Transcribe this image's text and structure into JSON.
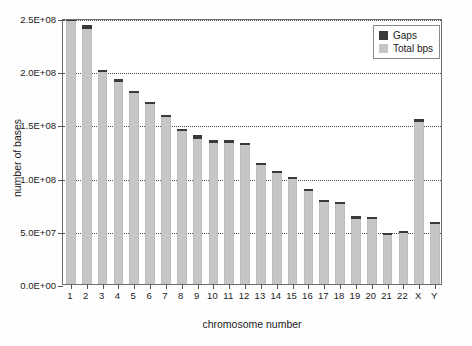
{
  "chart_data": {
    "type": "bar",
    "title": "",
    "xlabel": "chromosome number",
    "ylabel": "number of bases",
    "categories": [
      "1",
      "2",
      "3",
      "4",
      "5",
      "6",
      "7",
      "8",
      "9",
      "10",
      "11",
      "12",
      "13",
      "14",
      "15",
      "16",
      "17",
      "18",
      "19",
      "20",
      "21",
      "22",
      "X",
      "Y"
    ],
    "ylim": [
      0,
      250000000
    ],
    "ytick_values": [
      0,
      50000000,
      100000000,
      150000000,
      200000000,
      250000000
    ],
    "ytick_labels": [
      "0.0E+00",
      "5.0E+07",
      "1.0E+08",
      "1.5E+08",
      "2.0E+08",
      "2.5E+08"
    ],
    "grid": true,
    "grid_axis": "y",
    "legend_position": "top-right",
    "stacked": true,
    "series": [
      {
        "name": "Total bps",
        "color": "#c6c6c6",
        "values": [
          247000000,
          240000000,
          199500000,
          190000000,
          179500000,
          169000000,
          156500000,
          144000000,
          136500000,
          133000000,
          133000000,
          131000000,
          112000000,
          104000000,
          98500000,
          87000000,
          77500000,
          75500000,
          61500000,
          61000000,
          46000000,
          48000000,
          152000000,
          56000000
        ]
      },
      {
        "name": "Gaps",
        "color": "#3a3a3a",
        "values": [
          3000000,
          3000000,
          500000,
          3000000,
          1500000,
          2000000,
          2500000,
          2000000,
          3500000,
          2000000,
          2000000,
          2000000,
          2000000,
          2000000,
          1500000,
          2000000,
          1500000,
          500000,
          2500000,
          1000000,
          1000000,
          1000000,
          3000000,
          2000000
        ]
      }
    ],
    "totals": [
      250000000,
      243000000,
      200000000,
      193000000,
      181000000,
      171000000,
      159000000,
      146000000,
      140000000,
      135000000,
      135000000,
      133000000,
      114000000,
      106000000,
      100000000,
      89000000,
      79000000,
      76000000,
      64000000,
      62000000,
      47000000,
      49000000,
      155000000,
      58000000
    ]
  },
  "legend": {
    "items": [
      {
        "label": "Gaps",
        "swatch": "gaps"
      },
      {
        "label": "Total bps",
        "swatch": "total"
      }
    ]
  }
}
